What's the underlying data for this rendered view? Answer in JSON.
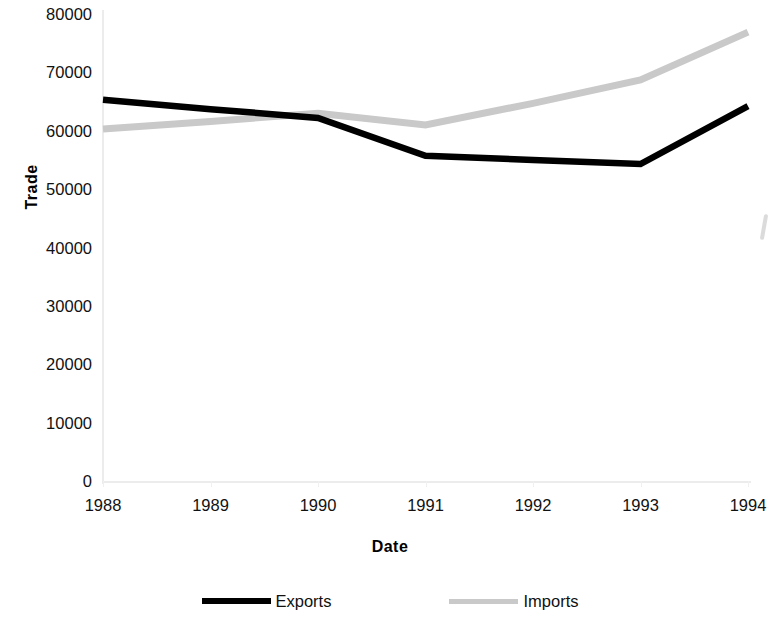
{
  "chart_data": {
    "type": "line",
    "title": "",
    "xlabel": "Date",
    "ylabel": "Trade",
    "categories": [
      "1988",
      "1989",
      "1990",
      "1991",
      "1992",
      "1993",
      "1994"
    ],
    "x": [
      1988,
      1989,
      1990,
      1991,
      1992,
      1993,
      1994
    ],
    "series": [
      {
        "name": "Exports",
        "color": "#000000",
        "values": [
          65300,
          63700,
          62200,
          55700,
          55000,
          54300,
          64200
        ]
      },
      {
        "name": "Imports",
        "color": "#c9c9c9",
        "values": [
          60300,
          61600,
          63000,
          61000,
          64700,
          68700,
          76900
        ]
      }
    ],
    "ylim": [
      0,
      80000
    ],
    "yticks": [
      0,
      10000,
      20000,
      30000,
      40000,
      50000,
      60000,
      70000,
      80000
    ],
    "ytick_labels": [
      "0",
      "10000",
      "20000",
      "30000",
      "40000",
      "50000",
      "60000",
      "70000",
      "80000"
    ],
    "xlim": [
      1988,
      1994
    ],
    "grid": false,
    "legend_position": "bottom"
  },
  "axes": {
    "y_title": "Trade",
    "x_title": "Date",
    "y_tick_labels": [
      "80000",
      "70000",
      "60000",
      "50000",
      "40000",
      "30000",
      "20000",
      "10000",
      "0"
    ],
    "x_tick_labels": [
      "1988",
      "1989",
      "1990",
      "1991",
      "1992",
      "1993",
      "1994"
    ]
  },
  "legend": {
    "entries": [
      {
        "label": "Exports",
        "color": "#000000",
        "style": "thick-solid"
      },
      {
        "label": "Imports",
        "color": "#c9c9c9",
        "style": "thick-solid"
      }
    ]
  }
}
